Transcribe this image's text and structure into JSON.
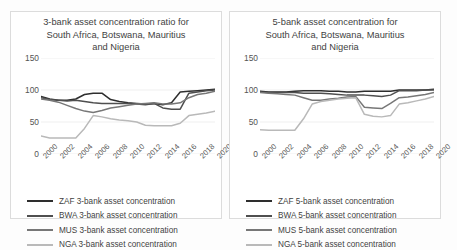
{
  "figure": {
    "background": "#fdfdfd",
    "panel_border": "#dcdcdc"
  },
  "series_colors": {
    "ZAF": "#2e2e2e",
    "BWA": "#4f4f4f",
    "MUS": "#777777",
    "NGA": "#b9b9b9"
  },
  "axis": {
    "y_ticks": [
      "150",
      "100",
      "50",
      "0"
    ],
    "x_ticks": [
      "2000",
      "2002",
      "2004",
      "2006",
      "2008",
      "2010",
      "2012",
      "2014",
      "2016",
      "2018",
      "2020"
    ]
  },
  "charts": [
    {
      "id": "chart-3bank",
      "title": "3-bank asset concentration ratio for South Africa, Botswana, Mauritius and Nigeria",
      "title_lines": [
        "3-bank asset concentration ratio for",
        "South Africa, Botswana, Mauritius",
        "and Nigeria"
      ],
      "legend": [
        {
          "label": "ZAF 3-bank asset concentration",
          "color": "#2e2e2e"
        },
        {
          "label": "BWA 3-bank asset concentration",
          "color": "#4f4f4f"
        },
        {
          "label": "MUS 3-bank asset concentration",
          "color": "#777777"
        },
        {
          "label": "NGA 3-bank asset concentration",
          "color": "#b9b9b9"
        }
      ]
    },
    {
      "id": "chart-5bank",
      "title": "5-bank asset concentration for South Africa, Botswana, Mauritius and Nigeria",
      "title_lines": [
        "5-bank asset concentration for",
        "South Africa, Botswana, Mauritius",
        "and Nigeria"
      ],
      "legend": [
        {
          "label": "ZAF 5-bank asset concentration",
          "color": "#2e2e2e"
        },
        {
          "label": "BWA 5-bank asset concentration",
          "color": "#4f4f4f"
        },
        {
          "label": "MUS 5-bank asset concentration",
          "color": "#777777"
        },
        {
          "label": "NGA 5-bank asset concentration",
          "color": "#b9b9b9"
        }
      ]
    }
  ],
  "chart_data": [
    {
      "type": "line",
      "id": "chart-3bank",
      "title": "3-bank asset concentration ratio for South Africa, Botswana, Mauritius and Nigeria",
      "xlabel": "",
      "ylabel": "",
      "ylim": [
        0,
        150
      ],
      "ytick_values": [
        0,
        50,
        100,
        150
      ],
      "grid": true,
      "legend_position": "below",
      "x": [
        2000,
        2001,
        2002,
        2003,
        2004,
        2005,
        2006,
        2007,
        2008,
        2009,
        2010,
        2011,
        2012,
        2013,
        2014,
        2015,
        2016,
        2017,
        2018,
        2019,
        2020
      ],
      "series": [
        {
          "name": "ZAF 3-bank asset concentration",
          "color": "#2e2e2e",
          "values": [
            90,
            86,
            84,
            84,
            86,
            93,
            95,
            95,
            85,
            82,
            80,
            79,
            78,
            79,
            77,
            80,
            97,
            98,
            99,
            100,
            101
          ]
        },
        {
          "name": "BWA 3-bank asset concentration",
          "color": "#4f4f4f",
          "values": [
            88,
            85,
            84,
            83,
            84,
            82,
            80,
            79,
            79,
            79,
            79,
            78,
            77,
            79,
            72,
            70,
            70,
            95,
            97,
            99,
            100
          ]
        },
        {
          "name": "MUS 3-bank asset concentration",
          "color": "#777777",
          "values": [
            86,
            84,
            81,
            76,
            71,
            67,
            65,
            68,
            72,
            74,
            76,
            78,
            79,
            80,
            78,
            78,
            80,
            88,
            93,
            95,
            98
          ]
        },
        {
          "name": "NGA 3-bank asset concentration",
          "color": "#b9b9b9",
          "values": [
            28,
            25,
            25,
            25,
            25,
            40,
            60,
            58,
            55,
            53,
            52,
            50,
            45,
            44,
            44,
            44,
            48,
            60,
            62,
            64,
            67
          ]
        }
      ]
    },
    {
      "type": "line",
      "id": "chart-5bank",
      "title": "5-bank asset concentration for South Africa, Botswana, Mauritius and Nigeria",
      "xlabel": "",
      "ylabel": "",
      "ylim": [
        0,
        150
      ],
      "ytick_values": [
        0,
        50,
        100,
        150
      ],
      "grid": true,
      "legend_position": "below",
      "x": [
        2000,
        2001,
        2002,
        2003,
        2004,
        2005,
        2006,
        2007,
        2008,
        2009,
        2010,
        2011,
        2012,
        2013,
        2014,
        2015,
        2016,
        2017,
        2018,
        2019,
        2020
      ],
      "series": [
        {
          "name": "ZAF 5-bank asset concentration",
          "color": "#2e2e2e",
          "values": [
            98,
            97,
            97,
            97,
            98,
            99,
            99,
            99,
            98,
            98,
            97,
            97,
            98,
            98,
            98,
            98,
            100,
            100,
            100,
            100,
            101
          ]
        },
        {
          "name": "BWA 5-bank asset concentration",
          "color": "#4f4f4f",
          "values": [
            97,
            96,
            96,
            96,
            96,
            95,
            95,
            95,
            94,
            93,
            92,
            92,
            92,
            91,
            90,
            92,
            99,
            99,
            99,
            100,
            100
          ]
        },
        {
          "name": "MUS 5-bank asset concentration",
          "color": "#777777",
          "values": [
            96,
            95,
            94,
            93,
            92,
            88,
            84,
            84,
            86,
            87,
            89,
            90,
            73,
            72,
            71,
            79,
            88,
            89,
            91,
            93,
            96
          ]
        },
        {
          "name": "NGA 5-bank asset concentration",
          "color": "#b9b9b9",
          "values": [
            38,
            37,
            37,
            37,
            37,
            55,
            78,
            82,
            84,
            86,
            87,
            88,
            62,
            59,
            58,
            60,
            78,
            80,
            83,
            86,
            90
          ]
        }
      ]
    }
  ]
}
